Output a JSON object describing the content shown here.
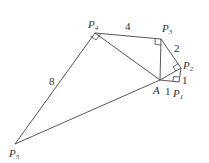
{
  "diagram": {
    "type": "geometry-figure",
    "points": {
      "A": {
        "label": "A",
        "x": 160,
        "y": 80
      },
      "P1": {
        "label": "P",
        "sub": "1",
        "x": 179,
        "y": 82
      },
      "P2": {
        "label": "P",
        "sub": "2",
        "x": 181,
        "y": 68
      },
      "P3": {
        "label": "P",
        "sub": "3",
        "x": 161,
        "y": 39
      },
      "P4": {
        "label": "P",
        "sub": "4",
        "x": 95,
        "y": 33
      },
      "P5": {
        "label": "P",
        "sub": "5",
        "x": 15,
        "y": 144
      }
    },
    "edge_labels": {
      "A_P1": "1",
      "P1_P2": "1",
      "P2_P3": "2",
      "P3_P4": "4",
      "P4_P5": "8"
    },
    "right_angles": [
      "P1",
      "P2",
      "P3",
      "P4"
    ],
    "stroke_color": "#444444"
  }
}
